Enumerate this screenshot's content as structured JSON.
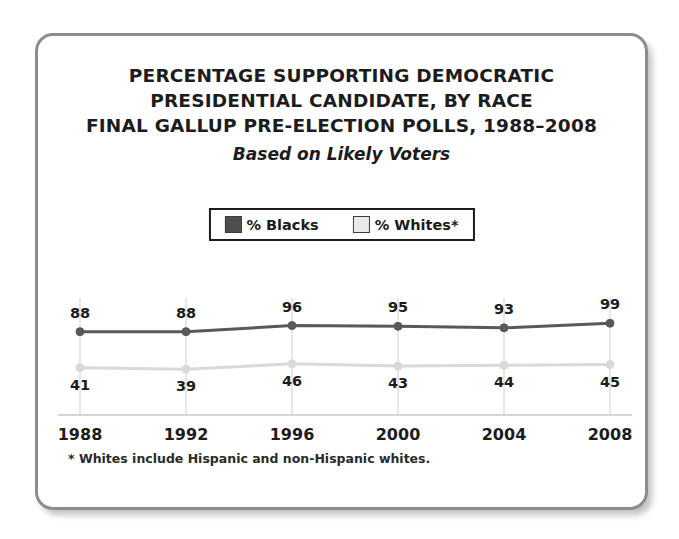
{
  "chart_data": {
    "type": "line",
    "title": "PERCENTAGE SUPPORTING DEMOCRATIC PRESIDENTIAL CANDIDATE, BY RACE FINAL GALLUP PRE-ELECTION POLLS, 1988–2008",
    "title_lines": [
      "PERCENTAGE SUPPORTING DEMOCRATIC",
      "PRESIDENTIAL CANDIDATE, BY RACE",
      "FINAL GALLUP PRE-ELECTION POLLS, 1988–2008"
    ],
    "subtitle": "Based on Likely Voters",
    "xlabel": "",
    "ylabel": "",
    "ylim": [
      0,
      100
    ],
    "grid": true,
    "legend_position": "top-center",
    "categories": [
      "1988",
      "1992",
      "1996",
      "2000",
      "2004",
      "2008"
    ],
    "x": [
      1988,
      1992,
      1996,
      2000,
      2004,
      2008
    ],
    "series": [
      {
        "name": "% Blacks",
        "color": "#595959",
        "swatch": "#4e4e4e",
        "values": [
          88,
          88,
          96,
          95,
          93,
          99
        ]
      },
      {
        "name": "% Whites*",
        "color": "#d9d9d9",
        "swatch": "#e9e9e9",
        "values": [
          41,
          39,
          46,
          43,
          44,
          45
        ]
      }
    ],
    "annotations": [
      "* Whites include Hispanic and non-Hispanic whites."
    ]
  },
  "legend": {
    "entries": [
      {
        "label": "% Blacks"
      },
      {
        "label": "% Whites*"
      }
    ]
  },
  "footnote": {
    "text": "* Whites include Hispanic and non-Hispanic whites."
  }
}
